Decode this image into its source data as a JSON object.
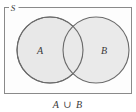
{
  "figure": {
    "type": "venn-diagram",
    "universal_set_label": "S",
    "caption": "A ∪ B",
    "sets": [
      {
        "id": "A",
        "label": "A",
        "label_x": 50,
        "label_y": 53,
        "cx": 50,
        "cy": 50,
        "r": 33
      },
      {
        "id": "B",
        "label": "B",
        "label_x": 96,
        "label_y": 53,
        "cx": 96,
        "cy": 50,
        "r": 33
      }
    ],
    "universe_rect": {
      "x": 4.5,
      "y": 7.5,
      "width": 127,
      "height": 86
    },
    "universal_label_pos": {
      "x": 13,
      "y": 10
    },
    "caption_pos": {
      "x": 68,
      "y": 107
    },
    "colors": {
      "circle_fill": "#e8e8e8",
      "circle_stroke": "#6b6b6b",
      "rect_stroke": "#8a8a8a",
      "rect_fill": "#fdfdfd",
      "text": "#3a3a3a",
      "background": "#ffffff"
    },
    "stroke_widths": {
      "circle": 1.1,
      "rect": 1.0
    },
    "font_sizes": {
      "set_label": 10,
      "universal_label": 9,
      "caption": 10
    }
  }
}
